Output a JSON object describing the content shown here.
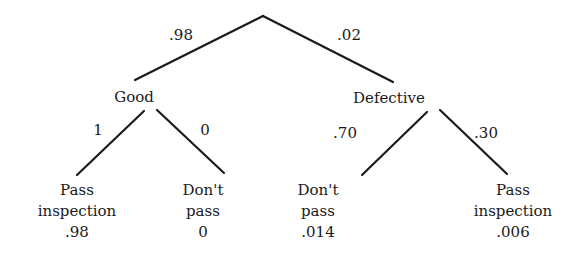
{
  "diagram": {
    "type": "probability-tree",
    "root": {
      "branches": [
        {
          "probability": ".98",
          "node": "Good",
          "branches": [
            {
              "probability": "1",
              "outcome_line1": "Pass",
              "outcome_line2": "inspection",
              "joint": ".98"
            },
            {
              "probability": "0",
              "outcome_line1": "Don't",
              "outcome_line2": "pass",
              "joint": "0"
            }
          ]
        },
        {
          "probability": ".02",
          "node": "Defective",
          "branches": [
            {
              "probability": ".70",
              "outcome_line1": "Don't",
              "outcome_line2": "pass",
              "joint": ".014"
            },
            {
              "probability": ".30",
              "outcome_line1": "Pass",
              "outcome_line2": "inspection",
              "joint": ".006"
            }
          ]
        }
      ]
    }
  }
}
